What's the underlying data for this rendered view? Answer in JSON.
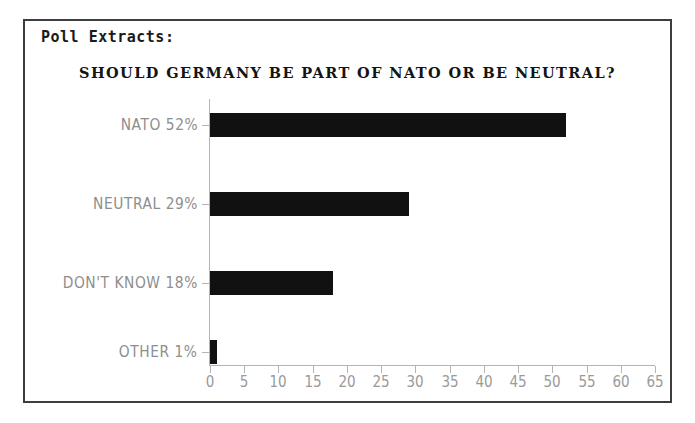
{
  "heading": "Poll Extracts:",
  "chart_data": {
    "type": "bar",
    "orientation": "horizontal",
    "title": "SHOULD GERMANY BE PART OF NATO OR BE NEUTRAL?",
    "xlabel": "",
    "ylabel": "",
    "categories": [
      "NATO",
      "NEUTRAL",
      "DON'T KNOW",
      "OTHER"
    ],
    "values": [
      52,
      29,
      18,
      1
    ],
    "axis_labels": [
      "NATO 52%",
      "NEUTRAL 29%",
      "DON'T KNOW 18%",
      "OTHER 1%"
    ],
    "xlim": [
      0,
      65
    ],
    "xticks": [
      0,
      5,
      10,
      15,
      20,
      25,
      30,
      35,
      40,
      45,
      50,
      55,
      60,
      65
    ],
    "xtick_labels": [
      "0",
      "5",
      "10",
      "15",
      "20",
      "25",
      "30",
      "35",
      "40",
      "45",
      "50",
      "55",
      "60",
      "65"
    ],
    "grid": false,
    "legend": false,
    "bar_color": "#111111",
    "axis_color": "#b4b4b4",
    "label_color": "#8e8e8e",
    "title_color": "#141414"
  }
}
